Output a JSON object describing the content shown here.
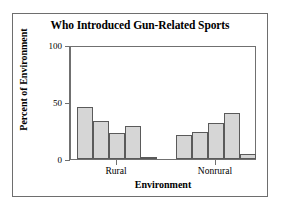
{
  "figure": {
    "background_color": "#ffffff",
    "frame_color": "#6e6e6e"
  },
  "chart_data": {
    "type": "bar",
    "title": "Who Introduced Gun-Related Sports",
    "xlabel": "Environment",
    "ylabel": "Percent of Environment",
    "categories": [
      "Rural",
      "Nonrural"
    ],
    "ylim": [
      0,
      100
    ],
    "yticks": [
      0,
      50,
      100
    ],
    "ytick_labels": [
      "0",
      "50",
      "100"
    ],
    "grid": false,
    "legend": false,
    "bar_fill_color": "#d6d6d6",
    "bar_edge_color": "#5a5a5a",
    "groups": [
      {
        "label": "Rural",
        "bars": [
          {
            "value": 46
          },
          {
            "value": 33
          },
          {
            "value": 23
          },
          {
            "value": 29
          },
          {
            "value": 2
          }
        ]
      },
      {
        "label": "Nonrural",
        "bars": [
          {
            "value": 21
          },
          {
            "value": 24
          },
          {
            "value": 32
          },
          {
            "value": 40
          },
          {
            "value": 4
          }
        ]
      }
    ]
  }
}
